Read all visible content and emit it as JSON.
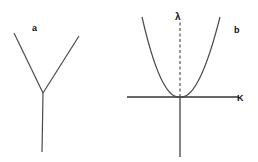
{
  "panels": [
    {
      "label": "a",
      "shape": "Y-shaped branching: two arms meeting at a junction with a single vertical stem below"
    },
    {
      "label": "b",
      "shape": "Parabola with vertex at the origin of a horizontal axis; dashed vertical arrow above origin",
      "axis_labels": {
        "horizontal": "K",
        "vertical": "λ"
      }
    }
  ],
  "colors": {
    "line": "#4a4a4a",
    "text": "#111111",
    "background": "#ffffff"
  }
}
